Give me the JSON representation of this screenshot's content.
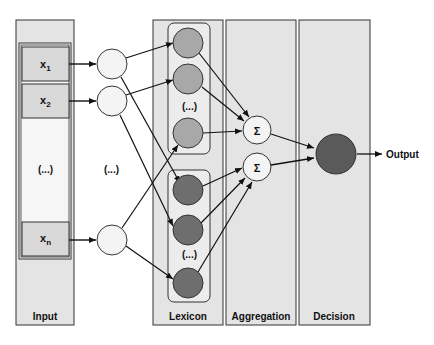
{
  "diagram": {
    "columns": [
      {
        "id": "input",
        "label": "Input"
      },
      {
        "id": "lexicon",
        "label": "Lexicon"
      },
      {
        "id": "aggregation",
        "label": "Aggregation"
      },
      {
        "id": "decision",
        "label": "Decision"
      }
    ],
    "inputs": [
      {
        "label": "x",
        "sub": "1"
      },
      {
        "label": "x",
        "sub": "2"
      },
      {
        "label": "x",
        "sub": "n"
      }
    ],
    "ellipsis": "(...)",
    "sum_symbol": "Σ",
    "output_label": "Output",
    "colors": {
      "panel_fill": "#e4e4e4",
      "input_box_fill": "#d8d8d8",
      "hidden_node_fill": "#f4f4f4",
      "lexicon_upper_fill": "#a8a8a8",
      "lexicon_lower_fill": "#6e6e6e",
      "decision_fill": "#5a5a5a",
      "stroke": "#222222"
    }
  }
}
